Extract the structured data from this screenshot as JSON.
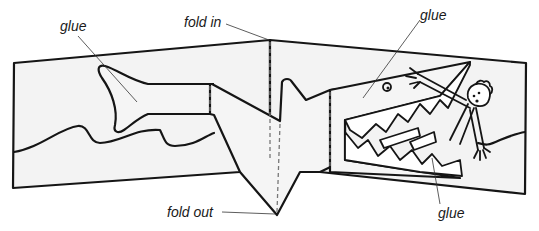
{
  "diagram": {
    "labels": {
      "glue_tail": "glue",
      "fold_in": "fold in",
      "glue_head": "glue",
      "fold_out": "fold out",
      "glue_mouth": "glue"
    },
    "colors": {
      "line": "#151515",
      "card_fill": "#f3f3f3",
      "fold_line": "#777777",
      "background": "#ffffff"
    }
  }
}
